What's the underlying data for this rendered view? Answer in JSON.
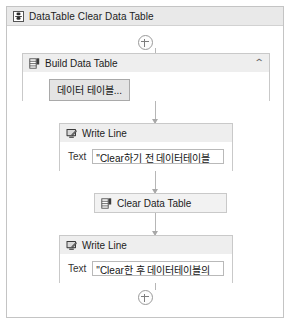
{
  "window": {
    "title": "DataTable Clear Data Table",
    "title_icon": "datatable-icon"
  },
  "colors": {
    "header_bg": "#e9e9e9",
    "node_header_bg": "#eeeeee",
    "border": "#c4c4c4",
    "connector": "#b6b6b6",
    "button_bg": "#e4e4e4"
  },
  "sequence": {
    "top_handle": {
      "icon": "plus-circle-icon",
      "label": "+"
    },
    "bottom_handle": {
      "icon": "plus-circle-icon",
      "label": "+"
    }
  },
  "nodes": [
    {
      "id": "build-data-table",
      "title": "Build Data Table",
      "icon": "datatable-icon",
      "collapse_icon": "chevron-up-icon",
      "button_label": "데이터 테이블..."
    },
    {
      "id": "write-line-1",
      "title": "Write Line",
      "icon": "write-line-icon",
      "arg_label": "Text",
      "arg_value": "\"Clear하기 전 데이터테이블"
    },
    {
      "id": "clear-data-table",
      "title": "Clear Data Table",
      "icon": "datatable-icon"
    },
    {
      "id": "write-line-2",
      "title": "Write Line",
      "icon": "write-line-icon",
      "arg_label": "Text",
      "arg_value": "\"Clear한 후 데이터테이블의"
    }
  ]
}
